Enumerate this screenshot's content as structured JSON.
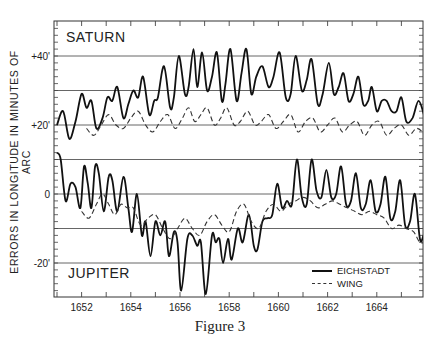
{
  "chart_data": {
    "type": "line",
    "title": "",
    "caption": "Figure 3",
    "ylabel": "ERRORS IN LONGITUDE IN MINUTES OF ARC",
    "xlabel": "",
    "xlim": [
      1651,
      1666
    ],
    "ylim": [
      -30,
      48
    ],
    "x_ticks": [
      "1652",
      "1654",
      "1656",
      "1658",
      "1660",
      "1662",
      "1664"
    ],
    "y_tick_labels": [
      {
        "value": 40,
        "label": "+40'"
      },
      {
        "value": 20,
        "label": "+20'"
      },
      {
        "value": 0,
        "label": "0"
      },
      {
        "value": -20,
        "label": "-20'"
      }
    ],
    "gridlines_y": [
      40,
      30,
      20,
      10,
      0,
      -10,
      -20
    ],
    "grid": true,
    "annotations": [
      {
        "text": "SATURN",
        "x": 1651.3,
        "y": 44
      },
      {
        "text": "JUPITER",
        "x": 1651.3,
        "y": -25
      }
    ],
    "legend": [
      {
        "label": "EICHSTADT",
        "style": "solid"
      },
      {
        "label": "WING",
        "style": "dashed"
      }
    ],
    "legend_position": "lower right",
    "series": [
      {
        "name": "Saturn — Eichstadt",
        "style": "solid",
        "points": [
          [
            1651,
            20
          ],
          [
            1651.25,
            24
          ],
          [
            1651.5,
            16
          ],
          [
            1651.75,
            21
          ],
          [
            1652,
            29
          ],
          [
            1652.2,
            25
          ],
          [
            1652.4,
            27
          ],
          [
            1652.6,
            19
          ],
          [
            1652.85,
            22
          ],
          [
            1653.05,
            28
          ],
          [
            1653.25,
            27
          ],
          [
            1653.45,
            31
          ],
          [
            1653.7,
            22
          ],
          [
            1653.9,
            26
          ],
          [
            1654.1,
            30
          ],
          [
            1654.3,
            28
          ],
          [
            1654.5,
            34
          ],
          [
            1654.75,
            23
          ],
          [
            1654.95,
            27
          ],
          [
            1655.1,
            28
          ],
          [
            1655.35,
            37
          ],
          [
            1655.6,
            25
          ],
          [
            1655.75,
            28
          ],
          [
            1655.95,
            40
          ],
          [
            1656.2,
            29
          ],
          [
            1656.35,
            31
          ],
          [
            1656.55,
            42
          ],
          [
            1656.7,
            31
          ],
          [
            1656.9,
            41
          ],
          [
            1657.1,
            30
          ],
          [
            1657.3,
            34
          ],
          [
            1657.5,
            41
          ],
          [
            1657.7,
            27
          ],
          [
            1657.85,
            32
          ],
          [
            1658.05,
            42
          ],
          [
            1658.3,
            27
          ],
          [
            1658.5,
            35
          ],
          [
            1658.7,
            42
          ],
          [
            1658.9,
            29
          ],
          [
            1659.1,
            34
          ],
          [
            1659.35,
            37
          ],
          [
            1659.6,
            31
          ],
          [
            1659.8,
            34
          ],
          [
            1660.05,
            41
          ],
          [
            1660.3,
            28
          ],
          [
            1660.5,
            29
          ],
          [
            1660.7,
            40
          ],
          [
            1660.95,
            30
          ],
          [
            1661.15,
            33
          ],
          [
            1661.35,
            39
          ],
          [
            1661.6,
            26
          ],
          [
            1661.8,
            29
          ],
          [
            1662.05,
            38
          ],
          [
            1662.25,
            29
          ],
          [
            1662.45,
            31
          ],
          [
            1662.65,
            35
          ],
          [
            1662.85,
            27
          ],
          [
            1663.05,
            29
          ],
          [
            1663.25,
            34
          ],
          [
            1663.45,
            26
          ],
          [
            1663.65,
            27
          ],
          [
            1663.8,
            31
          ],
          [
            1664,
            24
          ],
          [
            1664.2,
            27
          ],
          [
            1664.4,
            27
          ],
          [
            1664.6,
            24
          ],
          [
            1664.8,
            24
          ],
          [
            1665,
            28
          ],
          [
            1665.2,
            21
          ],
          [
            1665.45,
            22
          ],
          [
            1665.7,
            27
          ],
          [
            1665.95,
            22
          ],
          [
            1666,
            20
          ]
        ]
      },
      {
        "name": "Saturn — Wing",
        "style": "dashed",
        "points": [
          [
            1652.2,
            19
          ],
          [
            1652.5,
            17
          ],
          [
            1652.8,
            20
          ],
          [
            1653.1,
            23
          ],
          [
            1653.4,
            20
          ],
          [
            1653.7,
            19
          ],
          [
            1654,
            22
          ],
          [
            1654.3,
            24
          ],
          [
            1654.6,
            20
          ],
          [
            1654.9,
            18
          ],
          [
            1655.2,
            21
          ],
          [
            1655.5,
            23
          ],
          [
            1655.8,
            19
          ],
          [
            1656.1,
            22
          ],
          [
            1656.35,
            25
          ],
          [
            1656.6,
            21
          ],
          [
            1656.85,
            23
          ],
          [
            1657.1,
            25
          ],
          [
            1657.4,
            20
          ],
          [
            1657.65,
            22
          ],
          [
            1657.9,
            25
          ],
          [
            1658.2,
            20
          ],
          [
            1658.45,
            21
          ],
          [
            1658.75,
            24
          ],
          [
            1659.05,
            20
          ],
          [
            1659.3,
            21
          ],
          [
            1659.6,
            23
          ],
          [
            1659.9,
            19
          ],
          [
            1660.2,
            21
          ],
          [
            1660.5,
            23
          ],
          [
            1660.8,
            18
          ],
          [
            1661.1,
            21
          ],
          [
            1661.4,
            22
          ],
          [
            1661.7,
            18
          ],
          [
            1662,
            20
          ],
          [
            1662.3,
            22
          ],
          [
            1662.6,
            18
          ],
          [
            1662.9,
            20
          ],
          [
            1663.2,
            21
          ],
          [
            1663.5,
            17
          ],
          [
            1663.8,
            20
          ],
          [
            1664.1,
            21
          ],
          [
            1664.4,
            17
          ],
          [
            1664.7,
            19
          ],
          [
            1665,
            20
          ],
          [
            1665.3,
            17
          ],
          [
            1665.6,
            19
          ],
          [
            1665.85,
            18
          ],
          [
            1666,
            16
          ]
        ]
      },
      {
        "name": "Jupiter — Eichstadt",
        "style": "solid",
        "points": [
          [
            1651,
            12
          ],
          [
            1651.15,
            10
          ],
          [
            1651.35,
            -2
          ],
          [
            1651.55,
            3
          ],
          [
            1651.75,
            2
          ],
          [
            1651.95,
            -4
          ],
          [
            1652.1,
            8
          ],
          [
            1652.25,
            3
          ],
          [
            1652.4,
            -4
          ],
          [
            1652.55,
            8
          ],
          [
            1652.7,
            6
          ],
          [
            1652.9,
            -5
          ],
          [
            1653.1,
            5
          ],
          [
            1653.25,
            4
          ],
          [
            1653.45,
            -5
          ],
          [
            1653.7,
            5
          ],
          [
            1653.9,
            -4
          ],
          [
            1654.05,
            -11
          ],
          [
            1654.25,
            0
          ],
          [
            1654.45,
            -12
          ],
          [
            1654.6,
            -8
          ],
          [
            1654.8,
            -18
          ],
          [
            1655,
            -8
          ],
          [
            1655.2,
            -12
          ],
          [
            1655.4,
            -8
          ],
          [
            1655.55,
            -18
          ],
          [
            1655.75,
            -11
          ],
          [
            1655.9,
            -14
          ],
          [
            1656.05,
            -28
          ],
          [
            1656.3,
            -13
          ],
          [
            1656.5,
            -12
          ],
          [
            1656.7,
            -15
          ],
          [
            1656.85,
            -14
          ],
          [
            1657.05,
            -29
          ],
          [
            1657.3,
            -12
          ],
          [
            1657.45,
            -14
          ],
          [
            1657.6,
            -13
          ],
          [
            1657.75,
            -20
          ],
          [
            1657.95,
            -13
          ],
          [
            1658.1,
            -19
          ],
          [
            1658.35,
            -10
          ],
          [
            1658.55,
            -14
          ],
          [
            1658.8,
            -6
          ],
          [
            1659,
            -15
          ],
          [
            1659.15,
            -16
          ],
          [
            1659.35,
            -8
          ],
          [
            1659.55,
            -7
          ],
          [
            1659.75,
            -6
          ],
          [
            1659.95,
            3
          ],
          [
            1660.15,
            -4
          ],
          [
            1660.35,
            -2
          ],
          [
            1660.55,
            -3
          ],
          [
            1660.75,
            10
          ],
          [
            1660.95,
            -1
          ],
          [
            1661.15,
            -3
          ],
          [
            1661.35,
            10
          ],
          [
            1661.55,
            1
          ],
          [
            1661.75,
            -1
          ],
          [
            1661.95,
            7
          ],
          [
            1662.15,
            -1
          ],
          [
            1662.35,
            0
          ],
          [
            1662.55,
            8
          ],
          [
            1662.75,
            -3
          ],
          [
            1662.95,
            -2
          ],
          [
            1663.15,
            6
          ],
          [
            1663.35,
            -4
          ],
          [
            1663.55,
            -3
          ],
          [
            1663.75,
            4
          ],
          [
            1663.95,
            -5
          ],
          [
            1664.15,
            -3
          ],
          [
            1664.35,
            5
          ],
          [
            1664.55,
            -7
          ],
          [
            1664.75,
            -5
          ],
          [
            1664.95,
            4
          ],
          [
            1665.15,
            -9
          ],
          [
            1665.35,
            -8
          ],
          [
            1665.55,
            0
          ],
          [
            1665.75,
            -13
          ],
          [
            1665.9,
            -12
          ],
          [
            1666,
            -10
          ]
        ]
      },
      {
        "name": "Jupiter — Wing",
        "style": "dashed",
        "points": [
          [
            1652,
            -5
          ],
          [
            1652.3,
            -7
          ],
          [
            1652.6,
            -3
          ],
          [
            1652.85,
            0
          ],
          [
            1653.1,
            -3
          ],
          [
            1653.35,
            -6
          ],
          [
            1653.6,
            -3
          ],
          [
            1653.85,
            -4
          ],
          [
            1654.1,
            -4
          ],
          [
            1654.4,
            -9
          ],
          [
            1654.7,
            -7
          ],
          [
            1655,
            -6
          ],
          [
            1655.3,
            -10
          ],
          [
            1655.6,
            -13
          ],
          [
            1655.9,
            -10
          ],
          [
            1656.2,
            -7
          ],
          [
            1656.5,
            -10
          ],
          [
            1656.8,
            -12
          ],
          [
            1657.1,
            -8
          ],
          [
            1657.4,
            -6
          ],
          [
            1657.7,
            -9
          ],
          [
            1658,
            -11
          ],
          [
            1658.3,
            -5
          ],
          [
            1658.6,
            -3
          ],
          [
            1658.9,
            -8
          ],
          [
            1659.2,
            -10
          ],
          [
            1659.5,
            -5
          ],
          [
            1659.8,
            -3
          ],
          [
            1660.1,
            -5
          ],
          [
            1660.4,
            -3
          ],
          [
            1660.7,
            -2
          ],
          [
            1661,
            -1
          ],
          [
            1661.3,
            -2
          ],
          [
            1661.6,
            -4
          ],
          [
            1661.9,
            -3
          ],
          [
            1662.2,
            -2
          ],
          [
            1662.5,
            -3
          ],
          [
            1662.8,
            -4
          ],
          [
            1663.1,
            -5
          ],
          [
            1663.4,
            -6
          ],
          [
            1663.7,
            -5
          ],
          [
            1664,
            -6
          ],
          [
            1664.3,
            -7
          ],
          [
            1664.6,
            -10
          ],
          [
            1664.9,
            -9
          ],
          [
            1665.2,
            -10
          ],
          [
            1665.5,
            -11
          ],
          [
            1665.75,
            -14
          ],
          [
            1666,
            -14
          ]
        ]
      }
    ]
  },
  "caption": "Figure 3",
  "labels": {
    "ylabel": "ERRORS IN LONGITUDE IN MINUTES OF ARC",
    "saturn": "SATURN",
    "jupiter": "JUPITER",
    "legend_solid": "EICHSTADT",
    "legend_dashed": "WING"
  }
}
